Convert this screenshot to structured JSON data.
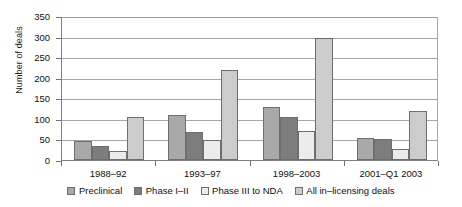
{
  "chart_data": {
    "type": "bar",
    "title": "",
    "xlabel": "",
    "ylabel": "Number of deals",
    "ylim": [
      0,
      350
    ],
    "ytick_step": 50,
    "yticks": [
      "0",
      "50",
      "100",
      "150",
      "200",
      "250",
      "300",
      "350"
    ],
    "grid": true,
    "legend_position": "bottom",
    "categories": [
      "1988–92",
      "1993–97",
      "1998–2003",
      "2001–Q1 2003"
    ],
    "series": [
      {
        "name": "Preclinical",
        "color": "#a9a9a9",
        "values": [
          47,
          110,
          128,
          53
        ]
      },
      {
        "name": "Phase I–II",
        "color": "#7d7d7d",
        "values": [
          35,
          68,
          105,
          52
        ]
      },
      {
        "name": "Phase III to NDA",
        "color": "#ececec",
        "values": [
          23,
          48,
          70,
          27
        ]
      },
      {
        "name": "All in–licensing deals",
        "color": "#cccccc",
        "values": [
          105,
          220,
          297,
          120
        ]
      }
    ]
  },
  "axis": {
    "y_title": "Number of deals"
  }
}
